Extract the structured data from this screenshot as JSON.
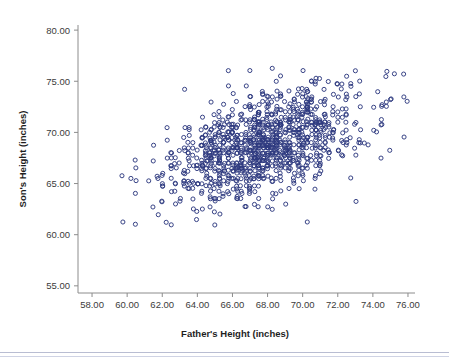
{
  "figure": {
    "type": "scatter-plot",
    "background_color": "#ffffff",
    "marker_color": "#2e3a80",
    "axis_color": "#8c8c8c",
    "text_color": "#3b3b3b"
  },
  "axes": {
    "x": {
      "title": "Father's Height (inches)",
      "tick_labels": [
        "58.00",
        "60.00",
        "62.00",
        "64.00",
        "66.00",
        "68.00",
        "70.00",
        "72.00",
        "74.00",
        "76.00"
      ],
      "tick_values": [
        58,
        60,
        62,
        64,
        66,
        68,
        70,
        72,
        74,
        76
      ],
      "min": 57.2,
      "max": 76.4
    },
    "y": {
      "title": "Son's Height (inches)",
      "tick_labels": [
        "55.00",
        "60.00",
        "65.00",
        "70.00",
        "75.00",
        "80.00"
      ],
      "tick_values": [
        55,
        60,
        65,
        70,
        75,
        80
      ],
      "min": 54.3,
      "max": 80.5
    }
  },
  "chart_data": {
    "type": "scatter",
    "title": "",
    "xlabel": "Father's Height (inches)",
    "ylabel": "Son's Height (inches)",
    "xlim": [
      57.2,
      76.4
    ],
    "ylim": [
      54.3,
      80.5
    ],
    "xticks": [
      58,
      60,
      62,
      64,
      66,
      68,
      70,
      72,
      74,
      76
    ],
    "yticks": [
      55,
      60,
      65,
      70,
      75,
      80
    ],
    "grid": false,
    "legend": "none",
    "marker": "open-circle",
    "marker_color": "#2e3a80",
    "n_points": 1078,
    "series": [
      {
        "name": "Father-Son heights",
        "description": "Galton style father/son height pairs; positive linear association, r approx 0.50, dense core near father 66-71 in and son 66-71 in.",
        "generator": {
          "mean_x": 67.7,
          "sd_x": 2.7,
          "mean_y": 68.7,
          "sd_y": 2.8,
          "correlation": 0.5,
          "seed": 20240517
        },
        "x": [],
        "y": []
      }
    ],
    "annotations": []
  }
}
